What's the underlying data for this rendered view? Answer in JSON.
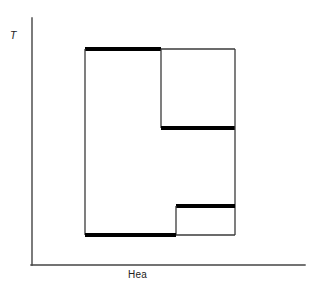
{
  "figure": {
    "width": 314,
    "height": 295,
    "background": "#ffffff"
  },
  "axes": {
    "y_label": "T",
    "x_label": "Hea",
    "color": "#444444",
    "line_width": 1.4,
    "origin_x": 32,
    "origin_y": 265,
    "y_top": 18,
    "x_right": 305
  },
  "chart_data": {
    "type": "line",
    "title": "",
    "xlabel": "Hea",
    "ylabel": "T",
    "grid": false,
    "legend": null,
    "xlim": [
      32,
      305
    ],
    "ylim": [
      265,
      18
    ],
    "vertices": [
      [
        85,
        49
      ],
      [
        161,
        49
      ],
      [
        161,
        128
      ],
      [
        235,
        128
      ],
      [
        235,
        206
      ],
      [
        176,
        206
      ],
      [
        176,
        235
      ],
      [
        85,
        235
      ]
    ],
    "segments": [
      {
        "name": "top-left-thick",
        "x1": 85,
        "y1": 49,
        "x2": 161,
        "y2": 49,
        "weight": "thick",
        "width": 4.2,
        "color": "#000000"
      },
      {
        "name": "top-right-thin",
        "x1": 161,
        "y1": 49,
        "x2": 235,
        "y2": 49,
        "weight": "thin",
        "width": 1.3,
        "color": "#3a3a3a"
      },
      {
        "name": "left-vertical-thin",
        "x1": 85,
        "y1": 49,
        "x2": 85,
        "y2": 235,
        "weight": "thin",
        "width": 1.3,
        "color": "#3a3a3a"
      },
      {
        "name": "mid-left-vertical-thin",
        "x1": 161,
        "y1": 49,
        "x2": 161,
        "y2": 128,
        "weight": "thin",
        "width": 1.3,
        "color": "#3a3a3a"
      },
      {
        "name": "mid-horizontal-thick",
        "x1": 161,
        "y1": 128,
        "x2": 235,
        "y2": 128,
        "weight": "thick",
        "width": 4.2,
        "color": "#000000"
      },
      {
        "name": "right-vertical-upper-thin",
        "x1": 235,
        "y1": 49,
        "x2": 235,
        "y2": 128,
        "weight": "thin",
        "width": 1.3,
        "color": "#3a3a3a"
      },
      {
        "name": "right-vertical-lower-thin",
        "x1": 235,
        "y1": 128,
        "x2": 235,
        "y2": 235,
        "weight": "thin",
        "width": 1.3,
        "color": "#3a3a3a"
      },
      {
        "name": "lower-step-thick",
        "x1": 176,
        "y1": 206,
        "x2": 235,
        "y2": 206,
        "weight": "thick",
        "width": 4.2,
        "color": "#000000"
      },
      {
        "name": "lower-step-vertical-thin",
        "x1": 176,
        "y1": 206,
        "x2": 176,
        "y2": 235,
        "weight": "thin",
        "width": 1.3,
        "color": "#3a3a3a"
      },
      {
        "name": "bottom-left-thick",
        "x1": 85,
        "y1": 235,
        "x2": 176,
        "y2": 235,
        "weight": "thick",
        "width": 4.2,
        "color": "#000000"
      },
      {
        "name": "bottom-right-thin",
        "x1": 176,
        "y1": 235,
        "x2": 235,
        "y2": 235,
        "weight": "thin",
        "width": 1.3,
        "color": "#3a3a3a"
      }
    ],
    "colors": {
      "thick_stroke": "#000000",
      "thin_stroke": "#3a3a3a",
      "axis": "#444444",
      "background": "#ffffff"
    }
  }
}
